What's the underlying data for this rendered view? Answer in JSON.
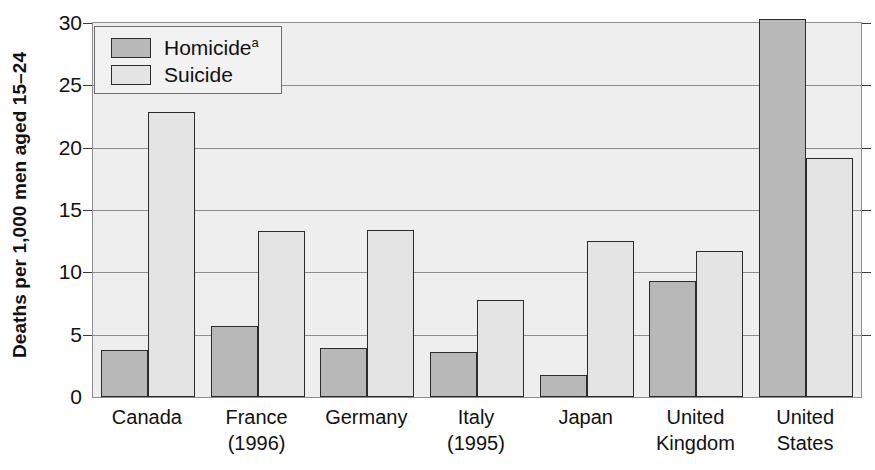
{
  "chart_data": {
    "type": "bar",
    "title": "",
    "xlabel": "",
    "ylabel": "Deaths per 1,000 men aged 15–24",
    "ylim": [
      0,
      30
    ],
    "yticks": [
      0,
      5,
      10,
      15,
      20,
      25,
      30
    ],
    "ytick_labels": [
      "0",
      "5",
      "10",
      "15",
      "20",
      "25",
      "30"
    ],
    "grid": true,
    "legend_position": "top-left",
    "categories": [
      "Canada",
      "France\n(1996)",
      "Germany",
      "Italy\n(1995)",
      "Japan",
      "United\nKingdom",
      "United\nStates"
    ],
    "category_lines": [
      [
        "Canada"
      ],
      [
        "France",
        "(1996)"
      ],
      [
        "Germany"
      ],
      [
        "Italy",
        "(1995)"
      ],
      [
        "Japan"
      ],
      [
        "United",
        "Kingdom"
      ],
      [
        "United",
        "States"
      ]
    ],
    "series": [
      {
        "name": "Homicide",
        "footnote_marker": "a",
        "color": "#b8b8b8",
        "values": [
          3.8,
          5.7,
          3.9,
          3.6,
          1.8,
          9.3,
          30.3
        ]
      },
      {
        "name": "Suicide",
        "footnote_marker": "",
        "color": "#e4e4e4",
        "values": [
          22.9,
          13.3,
          13.4,
          7.8,
          12.5,
          11.7,
          19.2
        ]
      }
    ]
  },
  "legend": {
    "items": [
      {
        "label": "Homicide",
        "sup": "a"
      },
      {
        "label": "Suicide",
        "sup": ""
      }
    ]
  },
  "colors": {
    "homicide_fill": "#b8b8b8",
    "suicide_fill": "#e4e4e4",
    "bar_edge": "#2b2b2b",
    "plot_background": "#eeeeee",
    "gridline": "#8d8d8d",
    "text": "#111111"
  }
}
